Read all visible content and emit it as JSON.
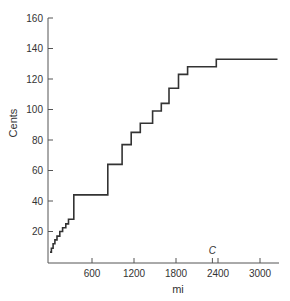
{
  "chart_data": {
    "type": "line",
    "subtype": "step",
    "title": "",
    "xlabel": "mi",
    "ylabel": "Cents",
    "xlim": [
      0,
      3250
    ],
    "ylim": [
      0,
      160
    ],
    "xticks": [
      600,
      1200,
      1800,
      2400,
      3000
    ],
    "xtick_labels": [
      "600",
      "1200",
      "1800",
      "2400",
      "3000"
    ],
    "yticks": [
      20,
      40,
      60,
      80,
      100,
      120,
      140,
      160
    ],
    "ytick_labels": [
      "20",
      "40",
      "60",
      "80",
      "100",
      "120",
      "140",
      "160"
    ],
    "grid": false,
    "legend": null,
    "annotations": [
      {
        "text": "C",
        "x": 2320
      }
    ],
    "series": [
      {
        "name": "cost",
        "color": "#333333",
        "steps": [
          {
            "x": 0,
            "y": 6.5
          },
          {
            "x": 20,
            "y": 9
          },
          {
            "x": 45,
            "y": 12
          },
          {
            "x": 70,
            "y": 14.5
          },
          {
            "x": 100,
            "y": 17
          },
          {
            "x": 140,
            "y": 20
          },
          {
            "x": 180,
            "y": 22.5
          },
          {
            "x": 225,
            "y": 25
          },
          {
            "x": 265,
            "y": 28
          },
          {
            "x": 340,
            "y": 44
          },
          {
            "x": 825,
            "y": 64
          },
          {
            "x": 1030,
            "y": 77
          },
          {
            "x": 1160,
            "y": 85
          },
          {
            "x": 1290,
            "y": 91
          },
          {
            "x": 1465,
            "y": 99
          },
          {
            "x": 1590,
            "y": 104
          },
          {
            "x": 1700,
            "y": 114
          },
          {
            "x": 1835,
            "y": 123
          },
          {
            "x": 1965,
            "y": 128
          },
          {
            "x": 2375,
            "y": 133
          },
          {
            "x": 3250,
            "y": 133
          }
        ]
      }
    ]
  }
}
